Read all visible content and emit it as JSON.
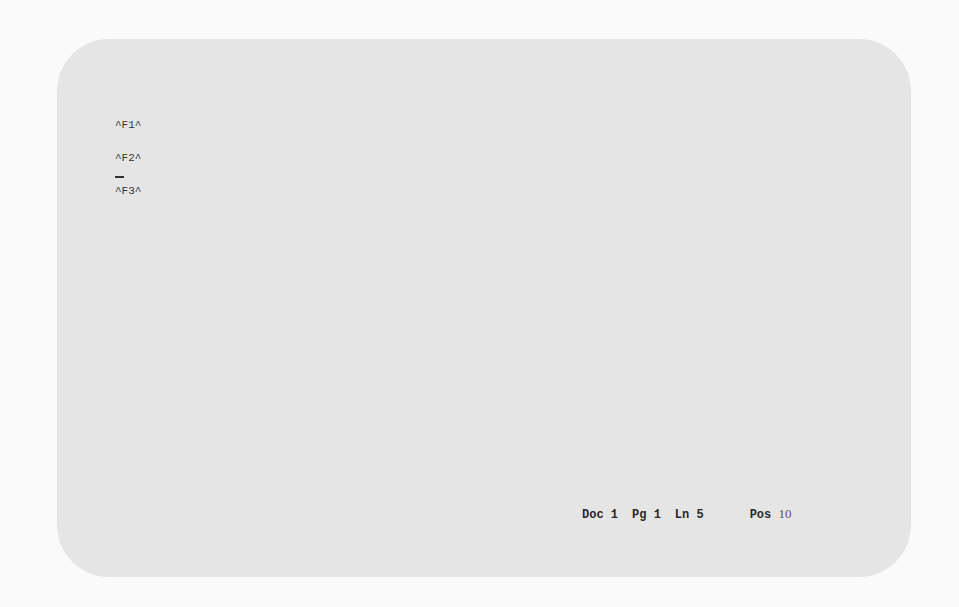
{
  "document": {
    "lines": [
      "^F1^",
      "^F2^",
      "^F3^"
    ],
    "cursor": "_"
  },
  "status_bar": {
    "doc_label": "Doc",
    "doc_value": "1",
    "page_label": "Pg",
    "page_value": "1",
    "line_label": "Ln",
    "line_value": "5",
    "pos_label": "Pos",
    "pos_value": "10"
  },
  "colors": {
    "screen_background": "#e5e5e5",
    "outer_background": "#fafafa",
    "text": "#333333"
  }
}
